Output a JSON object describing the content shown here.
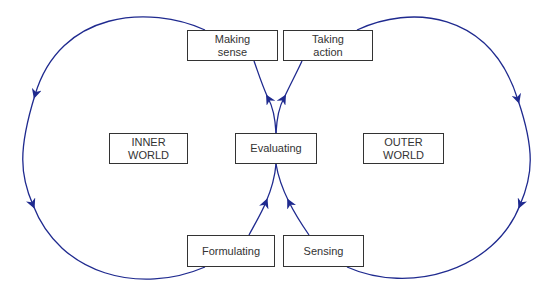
{
  "diagram": {
    "title": "",
    "colors": {
      "line": "#1f2a8f",
      "box_border": "#333333",
      "text": "#333333"
    },
    "boxes": {
      "making_sense": "Making\nsense",
      "taking_action": "Taking\naction",
      "inner_world": "INNER\nWORLD",
      "evaluating": "Evaluating",
      "outer_world": "OUTER\nWORLD",
      "formulating": "Formulating",
      "sensing": "Sensing"
    },
    "flows": [
      {
        "from": "Evaluating",
        "to": "Making sense"
      },
      {
        "from": "Making sense",
        "to": "Formulating",
        "via": "INNER WORLD loop"
      },
      {
        "from": "Formulating",
        "to": "Evaluating"
      },
      {
        "from": "Evaluating",
        "to": "Taking action"
      },
      {
        "from": "Taking action",
        "to": "Sensing",
        "via": "OUTER WORLD loop"
      },
      {
        "from": "Sensing",
        "to": "Evaluating"
      }
    ]
  }
}
